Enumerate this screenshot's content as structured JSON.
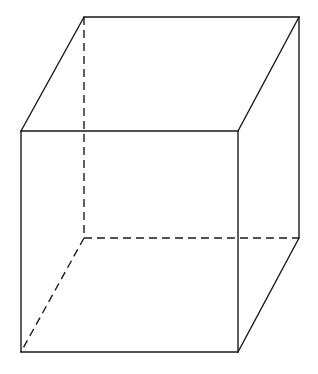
{
  "diagram": {
    "type": "cube-wireframe",
    "stroke_color": "#1a1a1a",
    "background": "#ffffff",
    "vertices": {
      "front_top_left": [
        21,
        131
      ],
      "front_top_right": [
        238,
        131
      ],
      "front_bottom_left": [
        21,
        352
      ],
      "front_bottom_right": [
        238,
        352
      ],
      "back_top_left": [
        84,
        17
      ],
      "back_top_right": [
        299,
        17
      ],
      "back_bottom_left": [
        84,
        238
      ],
      "back_bottom_right": [
        299,
        238
      ]
    },
    "solid_edges": [
      [
        "front_top_left",
        "front_top_right"
      ],
      [
        "front_top_right",
        "front_bottom_right"
      ],
      [
        "front_bottom_right",
        "front_bottom_left"
      ],
      [
        "front_bottom_left",
        "front_top_left"
      ],
      [
        "front_top_left",
        "back_top_left"
      ],
      [
        "back_top_left",
        "back_top_right"
      ],
      [
        "back_top_right",
        "front_top_right"
      ],
      [
        "back_top_right",
        "back_bottom_right"
      ],
      [
        "back_bottom_right",
        "front_bottom_right"
      ]
    ],
    "hidden_edges": [
      [
        "back_top_left",
        "back_bottom_left"
      ],
      [
        "back_bottom_left",
        "back_bottom_right"
      ],
      [
        "back_bottom_left",
        "front_bottom_left"
      ]
    ]
  }
}
